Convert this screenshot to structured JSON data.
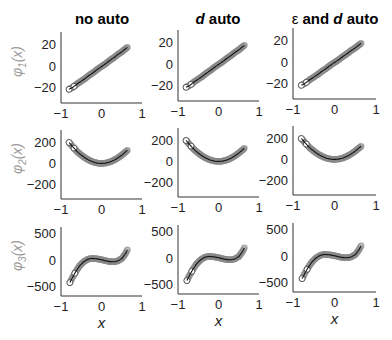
{
  "columns": [
    {
      "title": "no auto",
      "title_parts": [
        {
          "t": "no auto",
          "italic": false
        }
      ]
    },
    {
      "title": "d auto",
      "title_parts": [
        {
          "t": "d",
          "italic": true
        },
        {
          "t": " auto",
          "italic": false
        }
      ]
    },
    {
      "title": "ε and d auto",
      "title_parts": [
        {
          "t": "ε",
          "italic": false
        },
        {
          "t": " and ",
          "italic": false
        },
        {
          "t": "d",
          "italic": true
        },
        {
          "t": " auto",
          "italic": false
        }
      ]
    }
  ],
  "rows": [
    {
      "ylabel": "φ1(x)",
      "ylabel_base": "φ",
      "ylabel_sub": "1",
      "ylabel_arg": "(x)"
    },
    {
      "ylabel": "φ2(x)",
      "ylabel_base": "φ",
      "ylabel_sub": "2",
      "ylabel_arg": "(x)"
    },
    {
      "ylabel": "φ3(x)",
      "ylabel_base": "φ",
      "ylabel_sub": "3",
      "ylabel_arg": "(x)"
    }
  ],
  "xlabel": "x",
  "colors": {
    "marker_edge": "#8a8a8a",
    "marker_fill": "#b0b0b0",
    "line": "#111111",
    "axis": "#333333",
    "ylabel": "#9a9a9a"
  },
  "chart_data": [
    {
      "type": "scatter",
      "row": 0,
      "columns": [
        "no auto",
        "d auto",
        "ε and d auto"
      ],
      "ylabel": "φ1(x)",
      "xlabel": "",
      "xlim": [
        -1,
        1
      ],
      "ylim": [
        -30,
        30
      ],
      "xticks": [
        -1,
        0,
        1
      ],
      "yticks": [
        -20,
        0,
        20
      ],
      "grid": false,
      "series": [
        {
          "name": "samples (open circles)",
          "x": [
            -0.8,
            -0.7,
            -0.6,
            -0.5,
            -0.4,
            -0.3,
            -0.2,
            -0.1,
            0.0,
            0.1,
            0.2,
            0.3,
            0.4,
            0.5,
            0.6,
            0.65
          ],
          "y": [
            -21,
            -19,
            -16,
            -13.5,
            -11,
            -8,
            -5.5,
            -2.5,
            0,
            2.5,
            5.5,
            8,
            11,
            13.5,
            16.5,
            18
          ]
        },
        {
          "name": "fit (line)",
          "x": [
            -0.8,
            0.65
          ],
          "y": [
            -22,
            18
          ]
        }
      ]
    },
    {
      "type": "scatter",
      "row": 1,
      "columns": [
        "no auto",
        "d auto",
        "ε and d auto"
      ],
      "ylabel": "φ2(x)",
      "xlabel": "",
      "xlim": [
        -1,
        1
      ],
      "ylim": [
        -300,
        300
      ],
      "xticks": [
        -1,
        0,
        1
      ],
      "yticks": [
        -200,
        0,
        200
      ],
      "grid": false,
      "series": [
        {
          "name": "samples (open circles)",
          "x": [
            -0.8,
            -0.7,
            -0.6,
            -0.5,
            -0.4,
            -0.3,
            -0.2,
            -0.1,
            0.0,
            0.1,
            0.2,
            0.3,
            0.4,
            0.5,
            0.6,
            0.65
          ],
          "y": [
            200,
            155,
            112,
            80,
            52,
            30,
            13,
            4,
            0,
            4,
            13,
            30,
            52,
            80,
            112,
            130
          ]
        },
        {
          "name": "fit (line)",
          "formula": "≈ 310·x²"
        }
      ]
    },
    {
      "type": "scatter",
      "row": 2,
      "columns": [
        "no auto",
        "d auto",
        "ε and d auto"
      ],
      "ylabel": "φ3(x)",
      "xlabel": "x",
      "xlim": [
        -1,
        1
      ],
      "ylim": [
        -600,
        600
      ],
      "xticks": [
        -1,
        0,
        1
      ],
      "yticks": [
        -500,
        0,
        500
      ],
      "grid": false,
      "series": [
        {
          "name": "samples (open circles)",
          "x": [
            -0.78,
            -0.7,
            -0.65,
            -0.55,
            -0.45,
            -0.35,
            -0.25,
            -0.1,
            0.0,
            0.1,
            0.2,
            0.3,
            0.4,
            0.5,
            0.6,
            0.65
          ],
          "y": [
            -420,
            -300,
            -230,
            -110,
            -30,
            20,
            40,
            30,
            15,
            -5,
            -20,
            -25,
            -10,
            35,
            140,
            220
          ]
        }
      ]
    }
  ],
  "tick_labels": {
    "x": [
      "−1",
      "0",
      "1"
    ],
    "row0_y": [
      "20",
      "0",
      "−20"
    ],
    "row1_y": [
      "200",
      "0",
      "−200"
    ],
    "row2_y": [
      "500",
      "0",
      "−500"
    ]
  }
}
